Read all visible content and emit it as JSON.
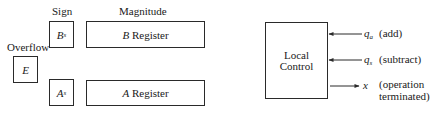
{
  "registers": {
    "sign_header": "Sign",
    "magnitude_header": "Magnitude",
    "overflow_label": "Overflow",
    "overflow_box": {
      "symbol": "E"
    },
    "bs_box": {
      "symbol": "B",
      "subscript": "s"
    },
    "as_box": {
      "symbol": "A",
      "subscript": "s"
    },
    "b_register": {
      "symbol": "B",
      "label": "Register"
    },
    "a_register": {
      "symbol": "A",
      "label": "Register"
    }
  },
  "control": {
    "title_line1": "Local",
    "title_line2": "Control",
    "signals": [
      {
        "symbol": "q",
        "subscript": "a",
        "description": "(add)",
        "direction": "in"
      },
      {
        "symbol": "q",
        "subscript": "s",
        "description": "(subtract)",
        "direction": "in"
      },
      {
        "symbol": "x",
        "subscript": "",
        "description_line1": "(operation",
        "description_line2": "terminated)",
        "direction": "out"
      }
    ]
  }
}
